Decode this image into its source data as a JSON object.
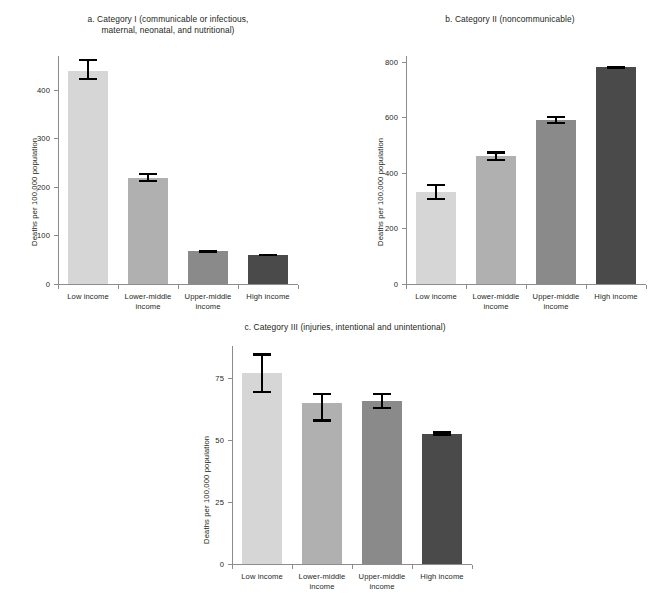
{
  "figure": {
    "ylabel": "Deaths per 100,000 population",
    "categories": [
      "Low income",
      "Lower-middle\nincome",
      "Upper-middle\nincome",
      "High income"
    ],
    "bar_colors": [
      "#d6d6d6",
      "#b0b0b0",
      "#8a8a8a",
      "#4a4a4a"
    ]
  },
  "chart_data": [
    {
      "type": "bar",
      "panel": "a",
      "title": "a. Category I (communicable or infectious,\nmaternal, neonatal, and nutritional)",
      "categories": [
        "Low income",
        "Lower-middle income",
        "Upper-middle income",
        "High income"
      ],
      "values": [
        440,
        219,
        67,
        60
      ],
      "errors_low": [
        420,
        210,
        64,
        58
      ],
      "errors_high": [
        464,
        229,
        70,
        62
      ],
      "xlabel": "",
      "ylabel": "Deaths per 100,000 population",
      "ylim": [
        0,
        470
      ],
      "yticks": [
        0,
        100,
        200,
        300,
        400
      ],
      "grid": false,
      "legend": "none"
    },
    {
      "type": "bar",
      "panel": "b",
      "title": "b. Category II (noncommunicable)",
      "categories": [
        "Low income",
        "Lower-middle income",
        "Upper-middle income",
        "High income"
      ],
      "values": [
        330,
        459,
        590,
        779
      ],
      "errors_low": [
        302,
        443,
        574,
        773
      ],
      "errors_high": [
        361,
        477,
        606,
        785
      ],
      "xlabel": "",
      "ylabel": "Deaths per 100,000 population",
      "ylim": [
        0,
        820
      ],
      "yticks": [
        0,
        200,
        400,
        600,
        800
      ],
      "grid": false,
      "legend": "none"
    },
    {
      "type": "bar",
      "panel": "c",
      "title": "c. Category III (injuries, intentional and unintentional)",
      "categories": [
        "Low income",
        "Lower-middle income",
        "Upper-middle income",
        "High income"
      ],
      "values": [
        77,
        65,
        66,
        52.5
      ],
      "errors_low": [
        69,
        57.5,
        62.5,
        51.5
      ],
      "errors_high": [
        85,
        69,
        69,
        53.5
      ],
      "xlabel": "",
      "ylabel": "Deaths per 100,000 population",
      "ylim": [
        0,
        88
      ],
      "yticks": [
        0,
        25,
        50,
        75
      ],
      "grid": false,
      "legend": "none"
    }
  ]
}
